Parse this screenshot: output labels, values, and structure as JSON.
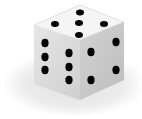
{
  "image": {
    "subject": "six-sided die",
    "faces": {
      "top": {
        "pips": 5
      },
      "left": {
        "pips": 6
      },
      "right": {
        "pips": 4
      }
    },
    "colors": {
      "background": "#ffffff",
      "shadow": "#ececec",
      "top_face": "#f4f4f4",
      "left_face": "#dcdcdc",
      "right_face": "#c8c8c8",
      "pip": "#000000"
    }
  }
}
